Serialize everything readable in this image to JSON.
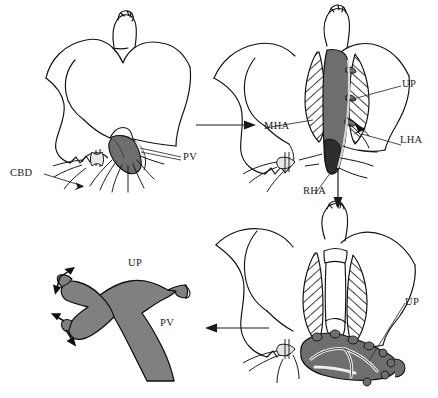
{
  "figure": {
    "width": 438,
    "height": 398,
    "background_color": "#ffffff",
    "ink_color": "#111111",
    "graft_fill_color": "#808080",
    "vessel_dark_fill_color": "#6e6e6e",
    "hatch_color": "#111111"
  },
  "labels": {
    "cbd": "CBD",
    "pv_top_left": "PV",
    "mha": "MHA",
    "up_top_right": "UP",
    "lha": "LHA",
    "rha": "RHA",
    "up_bottom_right": "UP",
    "up_bottom_left": "UP",
    "pv_bottom_left": "PV"
  },
  "panels": [
    {
      "id": "top-left",
      "name": "panel-top-left",
      "order": 1,
      "caption": "Native hilum with common bile duct and portal vein exposed",
      "labels": [
        "CBD",
        "PV"
      ]
    },
    {
      "id": "top-right",
      "name": "panel-top-right",
      "order": 2,
      "caption": "Hepatic artery branches and umbilical portion dissected",
      "labels": [
        "MHA",
        "UP",
        "LHA",
        "RHA"
      ]
    },
    {
      "id": "bottom-right",
      "name": "panel-bottom-right",
      "order": 3,
      "caption": "Umbilical portion harvested below the hilar plate",
      "labels": [
        "UP"
      ]
    },
    {
      "id": "bottom-left",
      "name": "panel-bottom-left",
      "order": 4,
      "caption": "Y-shaped umbilical portion vein graft ready for interposition",
      "labels": [
        "UP",
        "PV"
      ]
    }
  ],
  "flow_arrows": [
    {
      "name": "arrow-tl-to-tr",
      "direction": "right"
    },
    {
      "name": "arrow-tr-to-br",
      "direction": "down"
    },
    {
      "name": "arrow-br-to-bl",
      "direction": "left"
    }
  ]
}
